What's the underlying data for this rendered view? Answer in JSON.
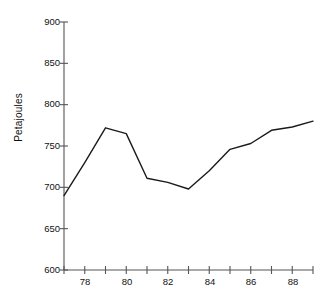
{
  "chart_data": {
    "type": "line",
    "title": "",
    "subtitle": "",
    "xlabel": "",
    "ylabel": "Petajoules",
    "x": [
      77,
      78,
      79,
      80,
      81,
      82,
      83,
      84,
      85,
      86,
      87,
      88,
      89
    ],
    "values": [
      690,
      730,
      772,
      765,
      711,
      706,
      698,
      720,
      746,
      753,
      769,
      773,
      780
    ],
    "series": [
      {
        "name": "Petajoules",
        "values": [
          690,
          730,
          772,
          765,
          711,
          706,
          698,
          720,
          746,
          753,
          769,
          773,
          780
        ]
      }
    ],
    "xlim": [
      77,
      89
    ],
    "ylim": [
      600,
      900
    ],
    "x_tick_values": [
      77,
      78,
      79,
      80,
      81,
      82,
      83,
      84,
      85,
      86,
      87,
      88,
      89
    ],
    "x_tick_labels": [
      "",
      "78",
      "",
      "80",
      "",
      "82",
      "",
      "84",
      "",
      "86",
      "",
      "88",
      ""
    ],
    "y_tick_values": [
      600,
      650,
      700,
      750,
      800,
      850,
      900
    ],
    "y_tick_labels": [
      "600",
      "650",
      "700",
      "750",
      "800",
      "850",
      "900"
    ],
    "grid": false,
    "legend": false,
    "legend_position": "none",
    "line_color": "#1a1a1a",
    "axis_color": "#555555",
    "background_color": "#ffffff"
  },
  "axes": {
    "y_label": "Petajoules",
    "y_ticks": [
      "900",
      "850",
      "800",
      "750",
      "700",
      "650",
      "600"
    ],
    "x_ticks": [
      "78",
      "80",
      "82",
      "84",
      "86",
      "88"
    ]
  }
}
